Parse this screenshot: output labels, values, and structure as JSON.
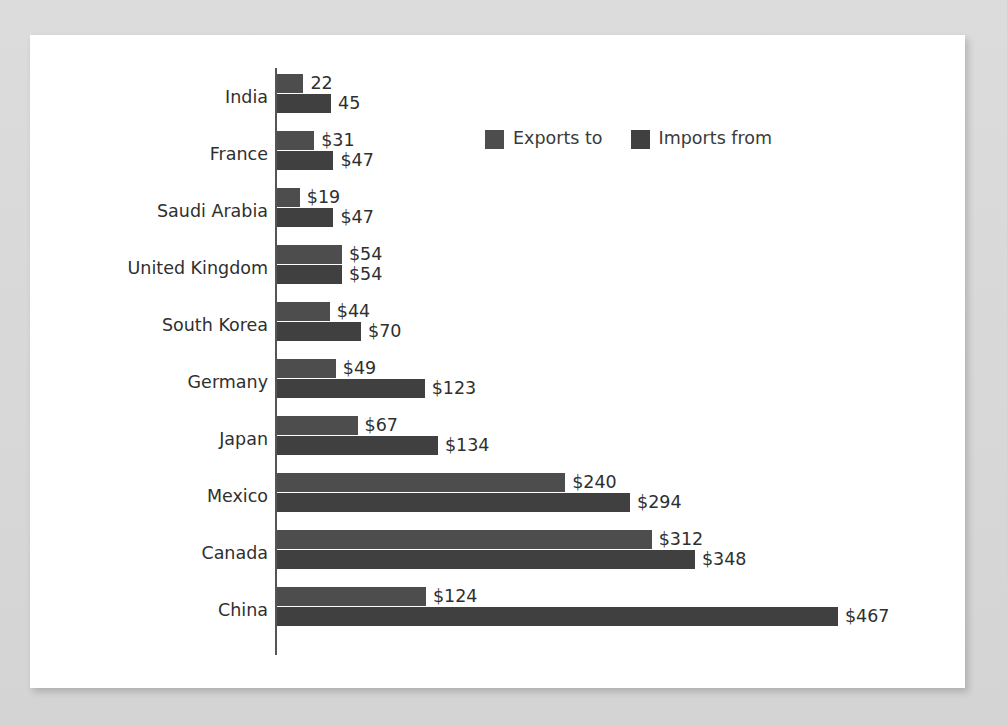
{
  "chart_data": {
    "type": "bar",
    "orientation": "horizontal",
    "grouping": "grouped",
    "title": "",
    "subtitle": "",
    "xlabel": "",
    "ylabel": "",
    "grid": false,
    "legend_position": "top-center",
    "xlim": [
      0,
      467
    ],
    "value_prefix": "$",
    "categories": [
      "India",
      "France",
      "Saudi Arabia",
      "United Kingdom",
      "South Korea",
      "Germany",
      "Japan",
      "Mexico",
      "Canada",
      "China"
    ],
    "series": [
      {
        "name": "Exports to",
        "color": "#4d4d4d",
        "values": [
          22,
          31,
          19,
          54,
          44,
          49,
          67,
          240,
          312,
          124
        ],
        "labels": [
          "22",
          "$31",
          "$19",
          "$54",
          "$44",
          "$49",
          "$67",
          "$240",
          "$312",
          "$124"
        ]
      },
      {
        "name": "Imports from",
        "color": "#404040",
        "values": [
          45,
          47,
          47,
          54,
          70,
          123,
          134,
          294,
          348,
          467
        ],
        "labels": [
          "45",
          "$47",
          "$47",
          "$54",
          "$70",
          "$123",
          "$134",
          "$294",
          "$348",
          "$467"
        ]
      }
    ]
  },
  "legend": {
    "items": [
      {
        "label": "Exports to",
        "color": "#4d4d4d"
      },
      {
        "label": "Imports from",
        "color": "#404040"
      }
    ]
  },
  "colors": {
    "page_background": "#d8d8d8",
    "card_background": "#ffffff",
    "axis": "#555555",
    "text": "#2f2f2f",
    "series_exports": "#4d4d4d",
    "series_imports": "#404040"
  }
}
